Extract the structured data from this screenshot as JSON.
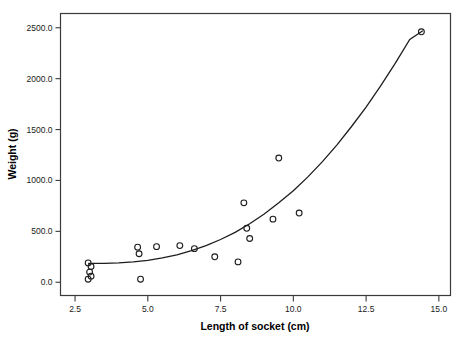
{
  "chart_data": {
    "type": "scatter",
    "title": "",
    "xlabel": "Length of socket (cm)",
    "ylabel": "Weight (g)",
    "xlim": [
      2.0,
      15.4
    ],
    "ylim": [
      -130,
      2640
    ],
    "xticks": [
      2.5,
      5.0,
      7.5,
      10.0,
      12.5,
      15.0
    ],
    "xticklabels": [
      "2.5",
      "5.0",
      "7.5",
      "10.0",
      "12.5",
      "15.0"
    ],
    "yticks": [
      0,
      500,
      1000,
      1500,
      2000,
      2500
    ],
    "yticklabels": [
      "0.0",
      "500.0",
      "1000.0",
      "1500.0",
      "2000.0",
      "2500.0"
    ],
    "grid": false,
    "legend": null,
    "marker": "open-circle",
    "marker_color": "#1d1d1d",
    "line_color": "#1d1d1d",
    "x": [
      2.95,
      3.05,
      3.0,
      3.05,
      2.95,
      4.65,
      4.7,
      4.75,
      5.3,
      6.1,
      6.6,
      7.3,
      8.1,
      8.3,
      8.4,
      8.5,
      9.3,
      9.5,
      10.2,
      14.4
    ],
    "y": [
      190,
      155,
      100,
      60,
      30,
      345,
      280,
      30,
      350,
      360,
      330,
      250,
      200,
      780,
      530,
      430,
      620,
      1220,
      680,
      2460
    ],
    "points": [
      {
        "x": 2.95,
        "y": 190
      },
      {
        "x": 3.05,
        "y": 155
      },
      {
        "x": 3.0,
        "y": 100
      },
      {
        "x": 3.05,
        "y": 60
      },
      {
        "x": 2.95,
        "y": 30
      },
      {
        "x": 4.65,
        "y": 345
      },
      {
        "x": 4.7,
        "y": 280
      },
      {
        "x": 4.75,
        "y": 30
      },
      {
        "x": 5.3,
        "y": 350
      },
      {
        "x": 6.1,
        "y": 360
      },
      {
        "x": 6.6,
        "y": 330
      },
      {
        "x": 7.3,
        "y": 250
      },
      {
        "x": 8.1,
        "y": 200
      },
      {
        "x": 8.3,
        "y": 780
      },
      {
        "x": 8.4,
        "y": 530
      },
      {
        "x": 8.5,
        "y": 430
      },
      {
        "x": 9.3,
        "y": 620
      },
      {
        "x": 9.5,
        "y": 1220
      },
      {
        "x": 10.2,
        "y": 680
      },
      {
        "x": 14.4,
        "y": 2460
      }
    ],
    "fit_curve": {
      "name": "fitted curve",
      "x": [
        2.95,
        3.5,
        4.0,
        4.5,
        5.0,
        5.5,
        6.0,
        6.5,
        7.0,
        7.5,
        8.0,
        8.5,
        9.0,
        9.5,
        10.0,
        10.5,
        11.0,
        11.5,
        12.0,
        12.5,
        13.0,
        13.5,
        14.0,
        14.45
      ],
      "y": [
        185,
        185,
        190,
        200,
        215,
        240,
        270,
        310,
        360,
        420,
        490,
        575,
        670,
        780,
        900,
        1035,
        1185,
        1350,
        1530,
        1720,
        1930,
        2150,
        2385,
        2470
      ]
    }
  }
}
